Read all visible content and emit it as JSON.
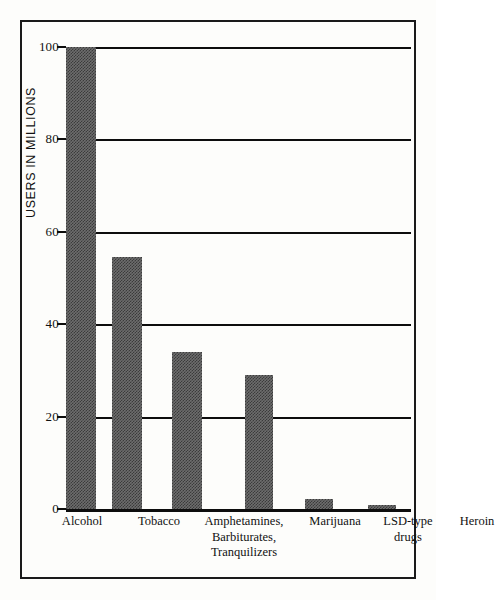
{
  "chart_data": {
    "type": "bar",
    "title": "",
    "subtitle": "",
    "xlabel": "",
    "ylabel": "USERS IN MILLIONS",
    "ylim": [
      0,
      100
    ],
    "ytick_labels": [
      "100",
      "80",
      "60",
      "40",
      "20",
      "0"
    ],
    "ytick_values": [
      100,
      80,
      60,
      40,
      20,
      0
    ],
    "grid": "horizontal",
    "legend": "none",
    "categories": [
      "Alcohol",
      "Tobacco",
      "Amphetamines,\nBarbiturates,\nTranquilizers",
      "Marijuana",
      "LSD-type\ndrugs",
      "Heroin"
    ],
    "values": [
      100,
      54.5,
      34,
      29,
      2.2,
      0.8
    ],
    "bar_color": "#6d6d6d",
    "bar_pattern": "halftone-checker",
    "axis_color": "#0d0d0d",
    "frame_color": "#1a1a1a",
    "background_color": "#fdfdfb",
    "bars": [
      {
        "category": "Alcohol",
        "label": "Alcohol",
        "value": 100
      },
      {
        "category": "Tobacco",
        "label": "Tobacco",
        "value": 54.5
      },
      {
        "category": "Amphetamines, Barbiturates, Tranquilizers",
        "label": "Amphetamines,\nBarbiturates,\nTranquilizers",
        "value": 34
      },
      {
        "category": "Marijuana",
        "label": "Marijuana",
        "value": 29
      },
      {
        "category": "LSD-type drugs",
        "label": "LSD-type\ndrugs",
        "value": 2.2
      },
      {
        "category": "Heroin",
        "label": "Heroin",
        "value": 0.8
      }
    ]
  },
  "axis": {
    "y_title": "USERS IN MILLIONS",
    "ticks": [
      {
        "label": "100",
        "value": 100
      },
      {
        "label": "80",
        "value": 80
      },
      {
        "label": "60",
        "value": 60
      },
      {
        "label": "40",
        "value": 40
      },
      {
        "label": "20",
        "value": 20
      },
      {
        "label": "0",
        "value": 0
      }
    ]
  },
  "layout": {
    "bar_geometry": [
      {
        "left": 0,
        "width": 30
      },
      {
        "left": 46,
        "width": 30
      },
      {
        "left": 106,
        "width": 30
      },
      {
        "left": 179,
        "width": 28
      },
      {
        "left": 239,
        "width": 28
      },
      {
        "left": 302,
        "width": 28
      }
    ],
    "label_geometry": [
      {
        "left": 22,
        "width": 76
      },
      {
        "left": 102,
        "width": 70
      },
      {
        "left": 168,
        "width": 108
      },
      {
        "left": 272,
        "width": 82
      },
      {
        "left": 348,
        "width": 76
      },
      {
        "left": 420,
        "width": 70
      }
    ]
  }
}
